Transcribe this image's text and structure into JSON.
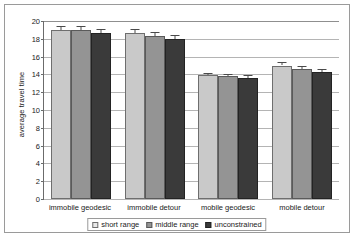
{
  "chart_data": {
    "type": "bar",
    "title": "",
    "xlabel": "",
    "ylabel": "average travel time",
    "ylim": [
      0,
      20
    ],
    "yticks": [
      0,
      2,
      4,
      6,
      8,
      10,
      12,
      14,
      16,
      18,
      20
    ],
    "ytick_labels": [
      "0",
      "2",
      "4",
      "6",
      "8",
      "10",
      "12",
      "14",
      "16",
      "18",
      "20"
    ],
    "grid": true,
    "legend_position": "bottom",
    "categories": [
      "immobile geodesic",
      "immobile detour",
      "mobile geodesic",
      "mobile detour"
    ],
    "series": [
      {
        "name": "short range",
        "color": "#c9c9c9",
        "values": [
          19.0,
          18.6,
          13.9,
          15.0
        ],
        "errors": [
          0.45,
          0.45,
          0.3,
          0.4
        ]
      },
      {
        "name": "middle range",
        "color": "#949494",
        "values": [
          19.0,
          18.3,
          13.8,
          14.6
        ],
        "errors": [
          0.45,
          0.45,
          0.3,
          0.4
        ]
      },
      {
        "name": "unconstrained",
        "color": "#3a3a3a",
        "values": [
          18.7,
          18.0,
          13.6,
          14.3
        ],
        "errors": [
          0.45,
          0.45,
          0.3,
          0.35
        ]
      }
    ]
  },
  "axis": {
    "y_title": "average travel time"
  },
  "legend": {
    "items": [
      {
        "label": "short range"
      },
      {
        "label": "middle range"
      },
      {
        "label": "unconstrained"
      }
    ]
  }
}
